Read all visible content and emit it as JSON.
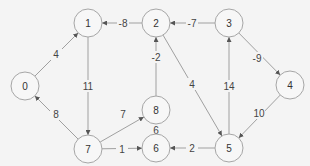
{
  "diagram": {
    "type": "directed-weighted-graph",
    "colors": {
      "background": "#f4f4f4",
      "node_stroke": "#a6a6a6",
      "node_fill": "#f7f7f7",
      "edge": "#a0a0a0",
      "text": "#333333"
    },
    "nodes": [
      {
        "id": "0",
        "label": "0",
        "x": 25,
        "y": 86
      },
      {
        "id": "1",
        "label": "1",
        "x": 88,
        "y": 23
      },
      {
        "id": "2",
        "label": "2",
        "x": 156,
        "y": 23
      },
      {
        "id": "3",
        "label": "3",
        "x": 229,
        "y": 23
      },
      {
        "id": "4",
        "label": "4",
        "x": 290,
        "y": 85
      },
      {
        "id": "5",
        "label": "5",
        "x": 229,
        "y": 148
      },
      {
        "id": "6",
        "label": "6",
        "x": 156,
        "y": 148
      },
      {
        "id": "7",
        "label": "7",
        "x": 88,
        "y": 149
      },
      {
        "id": "8",
        "label": "8",
        "x": 156,
        "y": 110
      }
    ],
    "edges": [
      {
        "from": "0",
        "to": "1",
        "weight": "4",
        "lx": 56,
        "ly": 54
      },
      {
        "from": "2",
        "to": "1",
        "weight": "-8",
        "lx": 123,
        "ly": 23
      },
      {
        "from": "3",
        "to": "2",
        "weight": "-7",
        "lx": 192,
        "ly": 23
      },
      {
        "from": "3",
        "to": "4",
        "weight": "-9",
        "lx": 257,
        "ly": 58
      },
      {
        "from": "1",
        "to": "7",
        "weight": "11",
        "lx": 88,
        "ly": 86
      },
      {
        "from": "7",
        "to": "0",
        "weight": "8",
        "lx": 56,
        "ly": 114
      },
      {
        "from": "7",
        "to": "8",
        "weight": "7",
        "lx": 123,
        "ly": 114
      },
      {
        "from": "7",
        "to": "6",
        "weight": "1",
        "lx": 122,
        "ly": 149
      },
      {
        "from": "8",
        "to": "2",
        "weight": "-2",
        "lx": 156,
        "ly": 57
      },
      {
        "from": "6",
        "to": "8",
        "weight": "6",
        "lx": 156,
        "ly": 130
      },
      {
        "from": "2",
        "to": "5",
        "weight": "4",
        "lx": 192,
        "ly": 84
      },
      {
        "from": "5",
        "to": "3",
        "weight": "14",
        "lx": 229,
        "ly": 86
      },
      {
        "from": "4",
        "to": "5",
        "weight": "10",
        "lx": 259,
        "ly": 113
      },
      {
        "from": "5",
        "to": "6",
        "weight": "2",
        "lx": 192,
        "ly": 148
      }
    ]
  }
}
